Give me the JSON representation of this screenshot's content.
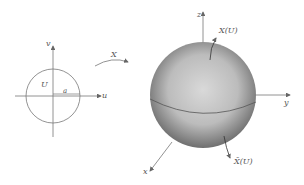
{
  "domain_view": {
    "parameter_plane": {
      "u_axis_label": "u",
      "v_axis_label": "v",
      "region_label": "U",
      "radius_label": "a"
    },
    "map_label": "X",
    "sphere": {
      "x_axis_label": "x",
      "y_axis_label": "y",
      "z_axis_label": "z",
      "upper_image_label": "X(U)",
      "lower_image_label": "X̄(U)"
    }
  }
}
